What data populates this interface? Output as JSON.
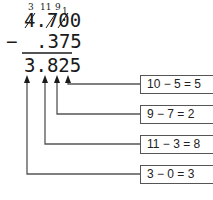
{
  "problem": {
    "borrow_marks": [
      "3",
      "11",
      "9",
      "1"
    ],
    "minuend": "4.700",
    "operator": "−",
    "subtrahend": ".375",
    "result": "3.825"
  },
  "steps": [
    {
      "label": "10 − 5 = 5"
    },
    {
      "label": "9 − 7 = 2"
    },
    {
      "label": "11 − 3 = 8"
    },
    {
      "label": "3 − 0 = 3"
    }
  ],
  "colors": {
    "line": "#555555",
    "text": "#1a1a1a"
  }
}
